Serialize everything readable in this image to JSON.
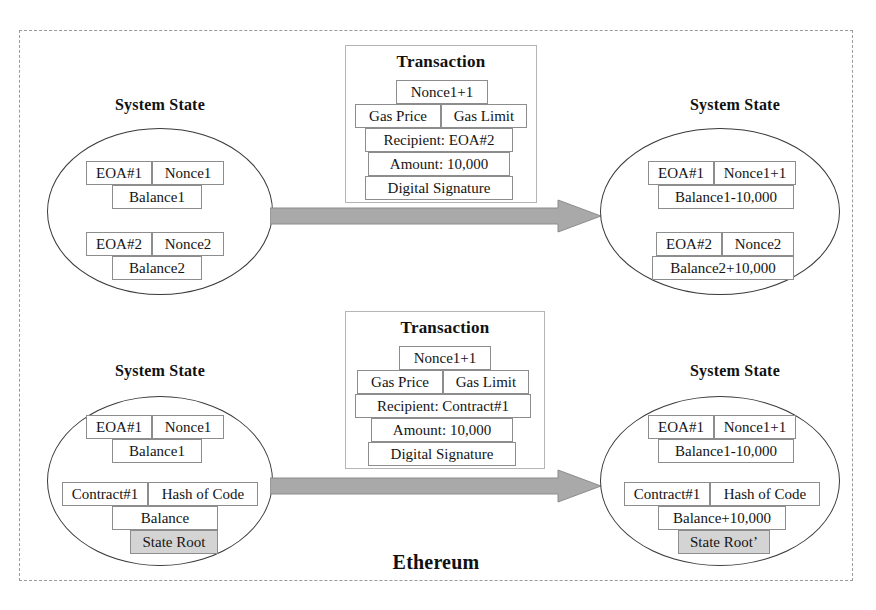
{
  "diagram": {
    "frame_label": "Ethereum",
    "frame_border_color": "#9a9a9a",
    "arrow_color": "#a8a8a8",
    "shaded_cell_color": "#d4d4d4"
  },
  "rows": [
    {
      "id": "eoa-transfer-row",
      "before": {
        "title": "System State",
        "accounts": [
          {
            "id": "eoa1",
            "left": "EOA#1",
            "right": "Nonce1",
            "under": "Balance1",
            "extra": null,
            "extra_shaded": false
          },
          {
            "id": "eoa2",
            "left": "EOA#2",
            "right": "Nonce2",
            "under": "Balance2",
            "extra": null,
            "extra_shaded": false
          }
        ]
      },
      "transaction": {
        "title": "Transaction",
        "nonce": "Nonce1+1",
        "gas_price": "Gas Price",
        "gas_limit": "Gas Limit",
        "recipient": "Recipient: EOA#2",
        "amount": "Amount: 10,000",
        "signature": "Digital Signature"
      },
      "after": {
        "title": "System State",
        "accounts": [
          {
            "id": "eoa1-after",
            "left": "EOA#1",
            "right": "Nonce1+1",
            "under": "Balance1-10,000",
            "extra": null,
            "extra_shaded": false
          },
          {
            "id": "eoa2-after",
            "left": "EOA#2",
            "right": "Nonce2",
            "under": "Balance2+10,000",
            "extra": null,
            "extra_shaded": false
          }
        ]
      }
    },
    {
      "id": "contract-call-row",
      "before": {
        "title": "System State",
        "accounts": [
          {
            "id": "eoa1-b",
            "left": "EOA#1",
            "right": "Nonce1",
            "under": "Balance1",
            "extra": null,
            "extra_shaded": false
          },
          {
            "id": "contract1",
            "left": "Contract#1",
            "right": "Hash of Code",
            "under": "Balance",
            "extra": "State Root",
            "extra_shaded": true
          }
        ]
      },
      "transaction": {
        "title": "Transaction",
        "nonce": "Nonce1+1",
        "gas_price": "Gas Price",
        "gas_limit": "Gas Limit",
        "recipient": "Recipient: Contract#1",
        "amount": "Amount: 10,000",
        "signature": "Digital Signature"
      },
      "after": {
        "title": "System State",
        "accounts": [
          {
            "id": "eoa1-b-after",
            "left": "EOA#1",
            "right": "Nonce1+1",
            "under": "Balance1-10,000",
            "extra": null,
            "extra_shaded": false
          },
          {
            "id": "contract1-after",
            "left": "Contract#1",
            "right": "Hash of Code",
            "under": "Balance+10,000",
            "extra": "State Root’",
            "extra_shaded": true
          }
        ]
      }
    }
  ]
}
